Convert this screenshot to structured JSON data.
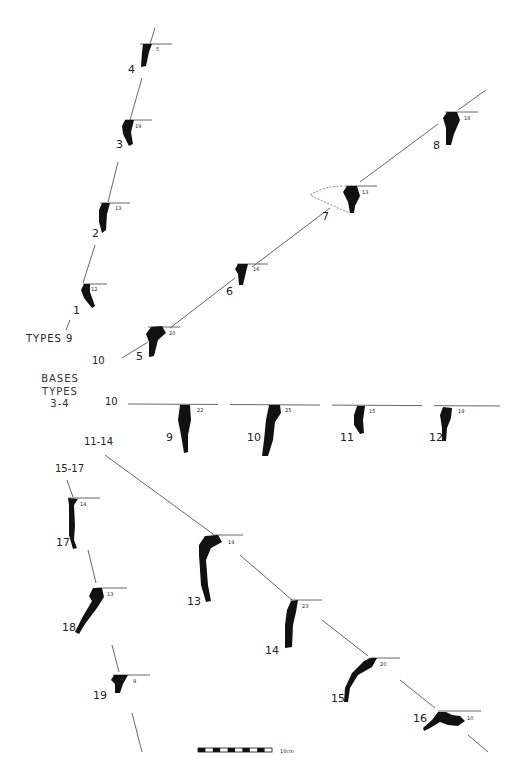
{
  "figure": {
    "headings": {
      "types_9": "TYPES  9",
      "bases_types_1": "BASES",
      "bases_types_2": "TYPES",
      "bases_types_3": "3-4"
    },
    "group_labels": {
      "g10_top": "10",
      "g10_mid": "10",
      "g11_14": "11-14",
      "g15_17": "15-17",
      "g9": "9"
    },
    "profiles": [
      {
        "id": "4",
        "diameter": "5"
      },
      {
        "id": "3",
        "diameter": "19"
      },
      {
        "id": "2",
        "diameter": "13"
      },
      {
        "id": "1",
        "diameter": "12"
      },
      {
        "id": "5",
        "diameter": "20"
      },
      {
        "id": "6",
        "diameter": "16"
      },
      {
        "id": "7",
        "diameter": "13"
      },
      {
        "id": "8",
        "diameter": "18"
      },
      {
        "id": "9",
        "diameter": "22"
      },
      {
        "id": "10",
        "diameter": "25"
      },
      {
        "id": "11",
        "diameter": "15"
      },
      {
        "id": "12",
        "diameter": "19"
      },
      {
        "id": "17",
        "diameter": "14"
      },
      {
        "id": "18",
        "diameter": "13"
      },
      {
        "id": "19",
        "diameter": "9"
      },
      {
        "id": "13",
        "diameter": "19"
      },
      {
        "id": "14",
        "diameter": "23"
      },
      {
        "id": "15",
        "diameter": "20"
      },
      {
        "id": "16",
        "diameter": "10"
      }
    ],
    "scale_bar": {
      "label": "10cm",
      "segments": 10
    },
    "colors": {
      "ink": "#111111",
      "line": "#555555",
      "background": "#ffffff"
    }
  }
}
